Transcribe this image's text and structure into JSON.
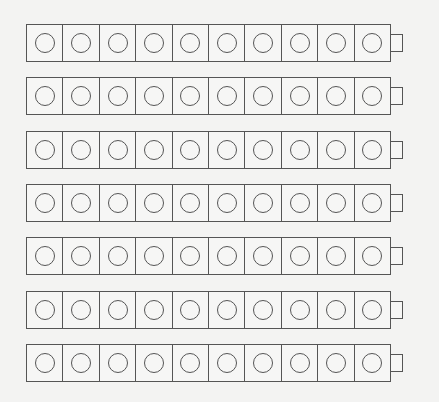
{
  "worksheet": {
    "rows": 7,
    "cubes_per_row": 10,
    "total_cubes": 70,
    "cube_icon": "circle-icon",
    "connector_icon": "tab-icon",
    "line_color": "#555555",
    "background_color": "#f3f3f2"
  }
}
